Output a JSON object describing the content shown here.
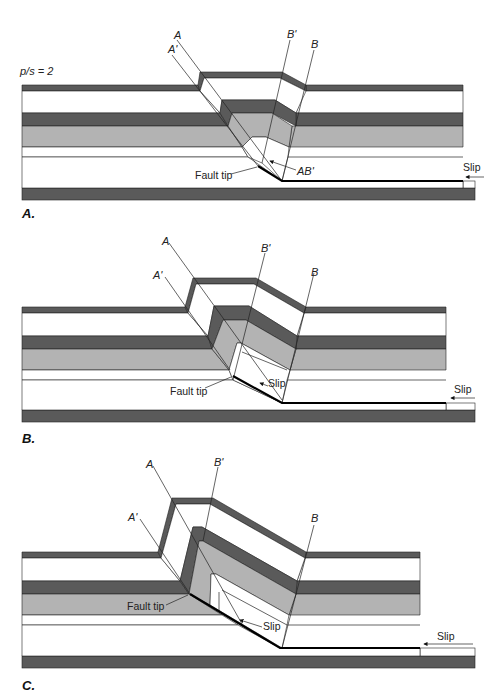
{
  "figure": {
    "ratio_label": "p/s = 2",
    "colors": {
      "dark_layer": "#5a5a5a",
      "gray_layer": "#b3b3b3",
      "white_layer": "#ffffff",
      "line": "#222222"
    },
    "panels": [
      {
        "id": "A",
        "panel_label": "A.",
        "axial_labels": [
          "A",
          "A'",
          "B'",
          "B"
        ],
        "annotations": {
          "fault_tip": "Fault tip",
          "ab": "AB'",
          "slip": "Slip"
        }
      },
      {
        "id": "B",
        "panel_label": "B.",
        "axial_labels": [
          "A",
          "A'",
          "B'",
          "B"
        ],
        "annotations": {
          "fault_tip": "Fault tip",
          "slip_inner": "Slip",
          "slip": "Slip"
        }
      },
      {
        "id": "C",
        "panel_label": "C.",
        "axial_labels": [
          "A",
          "A'",
          "B'",
          "B"
        ],
        "annotations": {
          "fault_tip": "Fault tip",
          "slip_inner": "Slip",
          "slip": "Slip"
        }
      }
    ]
  }
}
